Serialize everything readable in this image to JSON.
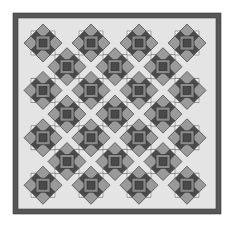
{
  "image": {
    "subject": "Quilt pattern",
    "width": 236,
    "height": 225
  },
  "colors": {
    "page_background": "#ffffff",
    "border": "#565656",
    "border_outline": "#3a3a3a",
    "setting_light": "#e4e4e4",
    "body_dark": "#4b4b4b",
    "diamond": "#9a9a9a",
    "diamond_outline": "#3c3c3c",
    "frame": "#8a8a8a",
    "frame_inner": "#4a4a4a",
    "corner_white": "#f2f2f2"
  },
  "quilt": {
    "outer": {
      "x": 13,
      "y": 13,
      "w": 208,
      "h": 201
    },
    "border_width": 5,
    "grid": {
      "origin_x": 43,
      "origin_y": 43,
      "pitch_x": 24,
      "pitch_y": 23.7,
      "count": 7
    },
    "framed_square": {
      "outer": 14,
      "inner": 8
    },
    "diamond": {
      "offset": 7.5,
      "half_diag": 7
    },
    "corner_white_triangle": 5
  }
}
